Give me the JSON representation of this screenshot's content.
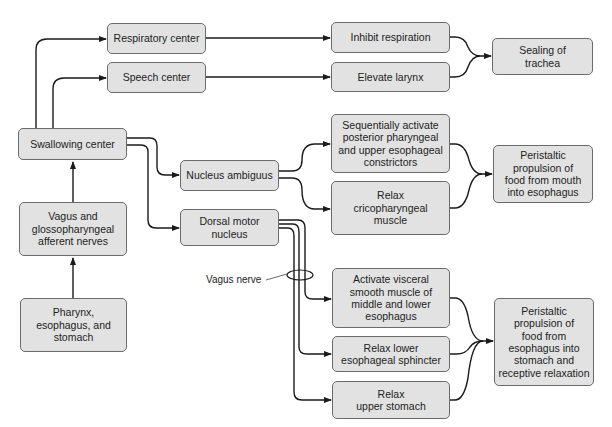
{
  "diagram": {
    "nodes": {
      "respiratory_center": "Respiratory center",
      "speech_center": "Speech center",
      "swallowing_center": "Swallowing center",
      "vagus_glosso_afferent": "Vagus and\nglossopharyngeal\nafferent nerves",
      "pharynx": "Pharynx,\nesophagus, and\nstomach",
      "nucleus_ambiguus": "Nucleus ambiguus",
      "dorsal_motor_nucleus": "Dorsal motor\nnucleus",
      "inhibit_respiration": "Inhibit respiration",
      "elevate_larynx": "Elevate larynx",
      "sealing_trachea": "Sealing of\ntrachea",
      "sequentially_activate": "Sequentially activate\nposterior pharyngeal\nand upper esophageal\nconstrictors",
      "relax_cricopharyngeal": "Relax\ncricopharyngeal\nmuscle",
      "peristaltic_mouth": "Peristaltic\npropulsion of\nfood from mouth\ninto esophagus",
      "activate_visceral": "Activate visceral\nsmooth muscle of\nmiddle and lower\nesophagus",
      "relax_les": "Relax lower\nesophageal sphincter",
      "relax_upper_stomach": "Relax\nupper stomach",
      "peristaltic_stomach": "Peristaltic\npropulsion of\nfood from\nesophagus into\nstomach and\nreceptive relaxation"
    },
    "annotations": {
      "vagus_nerve": "Vagus nerve"
    },
    "edges": [
      [
        "pharynx",
        "vagus_glosso_afferent"
      ],
      [
        "vagus_glosso_afferent",
        "swallowing_center"
      ],
      [
        "swallowing_center",
        "respiratory_center"
      ],
      [
        "swallowing_center",
        "speech_center"
      ],
      [
        "swallowing_center",
        "nucleus_ambiguus"
      ],
      [
        "swallowing_center",
        "dorsal_motor_nucleus"
      ],
      [
        "respiratory_center",
        "inhibit_respiration"
      ],
      [
        "speech_center",
        "elevate_larynx"
      ],
      [
        "inhibit_respiration",
        "sealing_trachea"
      ],
      [
        "elevate_larynx",
        "sealing_trachea"
      ],
      [
        "nucleus_ambiguus",
        "sequentially_activate"
      ],
      [
        "nucleus_ambiguus",
        "relax_cricopharyngeal"
      ],
      [
        "sequentially_activate",
        "peristaltic_mouth"
      ],
      [
        "relax_cricopharyngeal",
        "peristaltic_mouth"
      ],
      [
        "dorsal_motor_nucleus",
        "activate_visceral"
      ],
      [
        "dorsal_motor_nucleus",
        "relax_les"
      ],
      [
        "dorsal_motor_nucleus",
        "relax_upper_stomach"
      ],
      [
        "activate_visceral",
        "peristaltic_stomach"
      ],
      [
        "relax_les",
        "peristaltic_stomach"
      ],
      [
        "relax_upper_stomach",
        "peristaltic_stomach"
      ]
    ],
    "colors": {
      "box_fill": "#e2e2e2",
      "box_border": "#6b6b6b",
      "line": "#1a1a1a"
    }
  }
}
